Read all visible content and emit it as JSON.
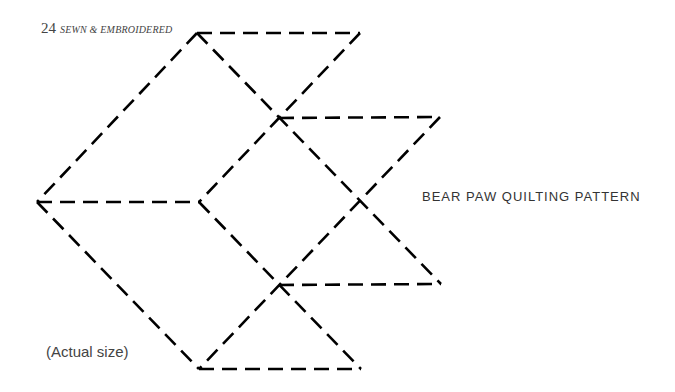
{
  "header": {
    "page_number": "24",
    "section": "SEWN & EMBROIDERED"
  },
  "pattern": {
    "title": "BEAR PAW QUILTING PATTERN",
    "caption": "(Actual size)",
    "stroke_color": "#000000",
    "segments": [
      [
        197,
        33,
        360,
        33
      ],
      [
        197,
        33,
        37,
        202
      ],
      [
        197,
        33,
        441,
        284
      ],
      [
        360,
        33,
        199,
        202
      ],
      [
        279,
        118,
        440,
        117
      ],
      [
        440,
        117,
        199,
        369
      ],
      [
        37,
        202,
        199,
        202
      ],
      [
        199,
        202,
        361,
        369
      ],
      [
        37,
        202,
        199,
        369
      ],
      [
        279,
        285,
        441,
        284
      ],
      [
        199,
        369,
        361,
        369
      ]
    ]
  }
}
